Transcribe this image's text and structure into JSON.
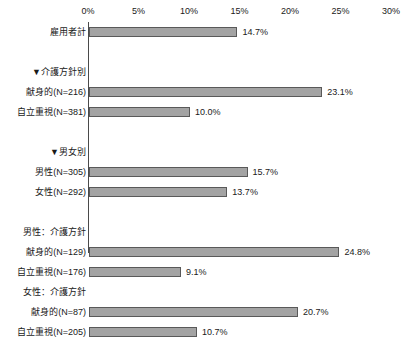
{
  "chart_data": {
    "type": "bar",
    "orientation": "horizontal",
    "title": "",
    "xlabel": "",
    "ylabel": "",
    "xlim": [
      0,
      30
    ],
    "grid": false,
    "legend": null,
    "axis_position": "top",
    "tick_labels": [
      "0%",
      "5%",
      "10%",
      "15%",
      "20%",
      "25%",
      "30%"
    ],
    "tick_values": [
      0,
      5,
      10,
      15,
      20,
      25,
      30
    ],
    "bar_color": "#a3a3a3",
    "bar_border_color": "#595959",
    "axis_color": "#4a4a4a",
    "rows": [
      {
        "label": "雇用者計",
        "value": 14.7,
        "value_label": "14.7%",
        "kind": "bar"
      },
      {
        "label": "",
        "value": null,
        "value_label": "",
        "kind": "spacer"
      },
      {
        "label": "▼介護方針別",
        "value": null,
        "value_label": "",
        "kind": "header"
      },
      {
        "label": "献身的(N=216)",
        "value": 23.1,
        "value_label": "23.1%",
        "kind": "bar"
      },
      {
        "label": "自立重視(N=381)",
        "value": 10.0,
        "value_label": "10.0%",
        "kind": "bar"
      },
      {
        "label": "",
        "value": null,
        "value_label": "",
        "kind": "spacer"
      },
      {
        "label": "▼男女別",
        "value": null,
        "value_label": "",
        "kind": "header"
      },
      {
        "label": "男性(N=305)",
        "value": 15.7,
        "value_label": "15.7%",
        "kind": "bar"
      },
      {
        "label": "女性(N=292)",
        "value": 13.7,
        "value_label": "13.7%",
        "kind": "bar"
      },
      {
        "label": "",
        "value": null,
        "value_label": "",
        "kind": "spacer"
      },
      {
        "label": "男性：介護方針",
        "value": null,
        "value_label": "",
        "kind": "header"
      },
      {
        "label": "献身的(N=129)",
        "value": 24.8,
        "value_label": "24.8%",
        "kind": "bar"
      },
      {
        "label": "自立重視(N=176)",
        "value": 9.1,
        "value_label": "9.1%",
        "kind": "bar"
      },
      {
        "label": "女性：介護方針",
        "value": null,
        "value_label": "",
        "kind": "header"
      },
      {
        "label": "献身的(N=87)",
        "value": 20.7,
        "value_label": "20.7%",
        "kind": "bar"
      },
      {
        "label": "自立重視(N=205)",
        "value": 10.7,
        "value_label": "10.7%",
        "kind": "bar"
      }
    ]
  }
}
